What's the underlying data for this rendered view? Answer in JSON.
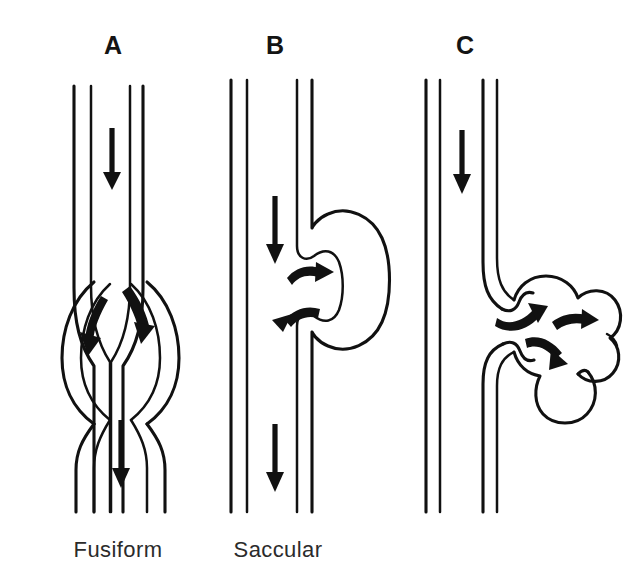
{
  "figure": {
    "background_color": "#ffffff",
    "ink_color": "#111111",
    "width": 636,
    "height": 588
  },
  "panels": [
    {
      "id": "A",
      "letter": "A",
      "caption": "Fusiform",
      "aneurysm_type": "fusiform",
      "description": "Symmetric spindle-shaped dilation of the entire circumference of the vessel wall",
      "letter_x": 113,
      "letter_y": 54,
      "caption_x": 118,
      "caption_y": 557,
      "flow_arrows": [
        {
          "name": "inflow-arrow",
          "shape": "straight",
          "direction": "down"
        },
        {
          "name": "turbulence-arrow-left",
          "shape": "curved",
          "direction": "down-left"
        },
        {
          "name": "turbulence-arrow-right",
          "shape": "curved",
          "direction": "down-right"
        },
        {
          "name": "outflow-arrow",
          "shape": "straight",
          "direction": "down"
        }
      ]
    },
    {
      "id": "B",
      "letter": "B",
      "caption": "Saccular",
      "aneurysm_type": "saccular",
      "description": "Outpouching of one side of the vessel wall forming a single sac",
      "letter_x": 275,
      "letter_y": 54,
      "caption_x": 278,
      "caption_y": 557,
      "flow_arrows": [
        {
          "name": "inflow-arrow",
          "shape": "straight",
          "direction": "down"
        },
        {
          "name": "sac-inflow-arrow",
          "shape": "curved",
          "direction": "right"
        },
        {
          "name": "sac-outflow-arrow",
          "shape": "curved",
          "direction": "left"
        },
        {
          "name": "outflow-arrow",
          "shape": "straight",
          "direction": "down"
        }
      ]
    },
    {
      "id": "C",
      "letter": "C",
      "caption": "",
      "aneurysm_type": "lobulated-berry",
      "description": "Multi-lobed berry aneurysm arising from a narrow neck on the vessel wall",
      "letter_x": 465,
      "letter_y": 54,
      "caption_x": 500,
      "caption_y": 557,
      "flow_arrows": [
        {
          "name": "inflow-arrow",
          "shape": "straight",
          "direction": "down"
        },
        {
          "name": "lobe-arrow-upper-left",
          "shape": "curved",
          "direction": "up-right"
        },
        {
          "name": "lobe-arrow-upper-right",
          "shape": "curved",
          "direction": "right"
        },
        {
          "name": "lobe-arrow-lower",
          "shape": "curved",
          "direction": "down-right"
        }
      ]
    }
  ]
}
